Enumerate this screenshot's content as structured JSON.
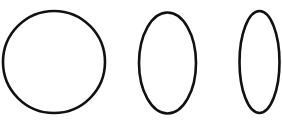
{
  "figure": {
    "width": 282,
    "height": 131,
    "background": "#ffffff",
    "stroke_color": "#111111",
    "stroke_width": 2.6,
    "shapes": [
      {
        "name": "circle",
        "cx": 54,
        "cy": 62,
        "rx": 51,
        "ry": 51
      },
      {
        "name": "medium-ellipse",
        "cx": 167.5,
        "cy": 63,
        "rx": 28.5,
        "ry": 50.5
      },
      {
        "name": "narrow-ellipse",
        "cx": 259.5,
        "cy": 62,
        "rx": 20,
        "ry": 51
      }
    ]
  }
}
